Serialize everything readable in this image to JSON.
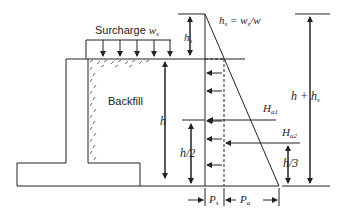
{
  "diagram": {
    "labels": {
      "surcharge": "Surcharge",
      "surcharge_sym": "w",
      "surcharge_sub": "s",
      "backfill": "Backfill",
      "hs": "h",
      "hs_sub": "s",
      "hs_eq_lhs": "h",
      "hs_eq_lhs_sub": "s",
      "hs_eq_rhs": " = w",
      "hs_eq_rhs_sub": "s",
      "hs_eq_tail": "/w",
      "h": "h",
      "h_half": "h/2",
      "h_third": "h/3",
      "h_plus_hs": "h + h",
      "h_plus_hs_sub": "s",
      "Ha1": "H",
      "Ha1_sub": "a1",
      "Ha2": "H",
      "Ha2_sub": "a2",
      "Ps": "P",
      "Ps_sub": "s",
      "Pa": "P",
      "Pa_sub": "a"
    },
    "colors": {
      "line": "#222222",
      "background": "#ffffff"
    }
  }
}
